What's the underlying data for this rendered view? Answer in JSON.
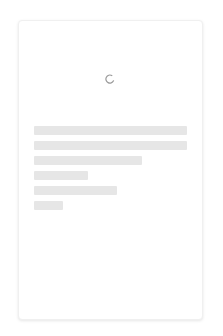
{
  "page": {
    "state": "loading"
  },
  "spinner": {
    "icon": "loading-spinner-icon",
    "color": "#9a9a9a"
  },
  "skeleton": {
    "color": "#e6e6e6",
    "bars": [
      {
        "width_px": 153
      },
      {
        "width_px": 153
      },
      {
        "width_px": 108
      },
      {
        "width_px": 54
      },
      {
        "width_px": 83
      },
      {
        "width_px": 29
      }
    ]
  }
}
